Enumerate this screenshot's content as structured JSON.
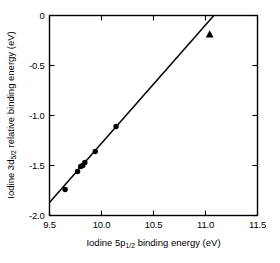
{
  "chart_data": {
    "type": "scatter",
    "title": "",
    "xlabel": "Iodine 5p binding energy (eV)",
    "xlabel_parts": {
      "main_1": "Iodine",
      "symbol": "5p",
      "subscript": "1/2",
      "main_2": "binding energy",
      "units": "(eV)"
    },
    "ylabel": "Iodine 3d relative binding energy (eV)",
    "ylabel_parts": {
      "main_1": "Iodine",
      "symbol": "3d",
      "subscript": "5/2",
      "main_2": "relative binding energy",
      "units": "(eV)"
    },
    "xlim": [
      9.5,
      11.5
    ],
    "ylim": [
      -2.0,
      0.0
    ],
    "xticks": [
      9.5,
      10.0,
      10.5,
      11.0,
      11.5
    ],
    "xtick_labels": [
      "9.5",
      "10.0",
      "10.5",
      "11.0",
      "11.5"
    ],
    "yticks": [
      0.0,
      -0.5,
      -1.0,
      -1.5,
      -2.0
    ],
    "ytick_labels": [
      "0",
      "-0.5",
      "-1.0",
      "-1.5",
      "-2.0"
    ],
    "grid": false,
    "legend": false,
    "tick_direction": "in",
    "series": [
      {
        "name": "circles",
        "marker": "circle",
        "color": "#000000",
        "points": [
          {
            "x": 9.65,
            "y": -1.74
          },
          {
            "x": 9.77,
            "y": -1.56
          },
          {
            "x": 9.8,
            "y": -1.51
          },
          {
            "x": 9.82,
            "y": -1.5
          },
          {
            "x": 9.84,
            "y": -1.47
          },
          {
            "x": 9.94,
            "y": -1.36
          },
          {
            "x": 10.14,
            "y": -1.11
          }
        ]
      },
      {
        "name": "triangle",
        "marker": "triangle",
        "color": "#000000",
        "points": [
          {
            "x": 11.04,
            "y": -0.19
          }
        ]
      }
    ],
    "fit_line": {
      "type": "line",
      "x_start": 9.5,
      "y_start": -1.87,
      "x_end": 11.08,
      "y_end": 0.0,
      "color": "#000000"
    }
  },
  "colors": {
    "background": "#ffffff",
    "ink": "#000000"
  }
}
